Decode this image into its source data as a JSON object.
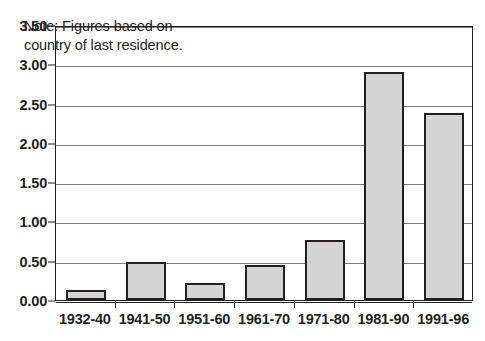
{
  "chart_data": {
    "type": "bar",
    "title": "",
    "subtitle": "",
    "xlabel": "",
    "ylabel": "",
    "categories": [
      "1932-40",
      "1941-50",
      "1951-60",
      "1961-70",
      "1971-80",
      "1981-90",
      "1991-96"
    ],
    "values": [
      0.13,
      0.49,
      0.22,
      0.44,
      0.76,
      2.9,
      2.38
    ],
    "ylim": [
      0.0,
      3.5
    ],
    "ytick_step": 0.5,
    "ytick_labels": [
      "0.00",
      "0.50",
      "1.00",
      "1.50",
      "2.00",
      "2.50",
      "3.00",
      "3.50"
    ],
    "ytick_values": [
      0.0,
      0.5,
      1.0,
      1.5,
      2.0,
      2.5,
      3.0,
      3.5
    ],
    "grid": "horizontal",
    "legend": null,
    "legend_position": "none",
    "annotations": [
      {
        "name": "note",
        "text": "Note: Figures based on\ncountry of last residence.",
        "position": "inside-top-left"
      }
    ],
    "colors": {
      "bar_fill": "#d4d4d4",
      "bar_border": "#231f20",
      "gridline": "#7d7d7d",
      "axis": "#231f20",
      "background": "#ffffff",
      "text": "#231f20"
    }
  }
}
